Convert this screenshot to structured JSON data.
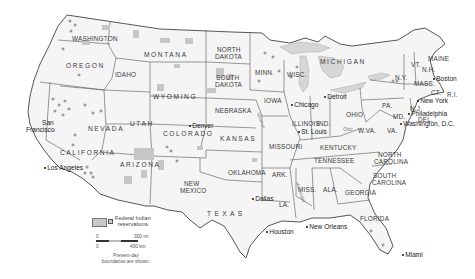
{
  "map": {
    "title": "United States - Federal Indian reservations",
    "states": [
      {
        "name": "WASHINGTON",
        "x": 72,
        "y": 36
      },
      {
        "name": "OREGON",
        "x": 66,
        "y": 63
      },
      {
        "name": "IDAHO",
        "x": 115,
        "y": 72
      },
      {
        "name": "MONTANA",
        "x": 144,
        "y": 52
      },
      {
        "name": "WYOMING",
        "x": 153,
        "y": 94
      },
      {
        "name": "NORTH",
        "x": 217,
        "y": 47
      },
      {
        "name": "DAKOTA",
        "x": 215,
        "y": 54
      },
      {
        "name": "SOUTH",
        "x": 216,
        "y": 75
      },
      {
        "name": "DAKOTA",
        "x": 215,
        "y": 82
      },
      {
        "name": "MINN.",
        "x": 255,
        "y": 70
      },
      {
        "name": "WISC.",
        "x": 287,
        "y": 72
      },
      {
        "name": "NEVADA",
        "x": 88,
        "y": 126
      },
      {
        "name": "UTAH",
        "x": 130,
        "y": 121
      },
      {
        "name": "COLORADO",
        "x": 163,
        "y": 131
      },
      {
        "name": "NEBRASKA",
        "x": 215,
        "y": 108
      },
      {
        "name": "IOWA",
        "x": 264,
        "y": 98
      },
      {
        "name": "KANSAS",
        "x": 220,
        "y": 136
      },
      {
        "name": "CALIFORNIA",
        "x": 60,
        "y": 150
      },
      {
        "name": "ARIZONA",
        "x": 120,
        "y": 162
      },
      {
        "name": "NEW",
        "x": 184,
        "y": 181
      },
      {
        "name": "MEXICO",
        "x": 180,
        "y": 188
      },
      {
        "name": "OKLAHOMA",
        "x": 228,
        "y": 170
      },
      {
        "name": "TEXAS",
        "x": 207,
        "y": 211
      },
      {
        "name": "MISSOURI",
        "x": 269,
        "y": 144
      },
      {
        "name": "ILLINOIS",
        "x": 292,
        "y": 121
      },
      {
        "name": "IND.",
        "x": 317,
        "y": 121
      },
      {
        "name": "OHIO",
        "x": 346,
        "y": 112
      },
      {
        "name": "MICHIGAN",
        "x": 320,
        "y": 59
      },
      {
        "name": "ARK.",
        "x": 272,
        "y": 172
      },
      {
        "name": "LA.",
        "x": 279,
        "y": 202
      },
      {
        "name": "MISS.",
        "x": 298,
        "y": 187
      },
      {
        "name": "ALA.",
        "x": 323,
        "y": 187
      },
      {
        "name": "GEORGIA",
        "x": 345,
        "y": 190
      },
      {
        "name": "FLORIDA",
        "x": 360,
        "y": 216
      },
      {
        "name": "TENNESSEE",
        "x": 314,
        "y": 158
      },
      {
        "name": "KENTUCKY",
        "x": 320,
        "y": 145
      },
      {
        "name": "W.VA.",
        "x": 358,
        "y": 128
      },
      {
        "name": "VA.",
        "x": 387,
        "y": 128
      },
      {
        "name": "PA.",
        "x": 382,
        "y": 103
      },
      {
        "name": "N.Y.",
        "x": 395,
        "y": 75
      },
      {
        "name": "VT.",
        "x": 411,
        "y": 62
      },
      {
        "name": "N.H.",
        "x": 422,
        "y": 67
      },
      {
        "name": "MAINE",
        "x": 428,
        "y": 56
      },
      {
        "name": "MASS.",
        "x": 414,
        "y": 81
      },
      {
        "name": "R.I.",
        "x": 447,
        "y": 92
      },
      {
        "name": "CT.",
        "x": 431,
        "y": 90
      },
      {
        "name": "N.J.",
        "x": 410,
        "y": 106
      },
      {
        "name": "DEL.",
        "x": 418,
        "y": 117
      },
      {
        "name": "MD.",
        "x": 393,
        "y": 114
      },
      {
        "name": "NORTH",
        "x": 378,
        "y": 152
      },
      {
        "name": "CAROLINA",
        "x": 374,
        "y": 159
      },
      {
        "name": "SOUTH",
        "x": 373,
        "y": 173
      },
      {
        "name": "CAROLINA",
        "x": 372,
        "y": 180
      }
    ],
    "cities": [
      {
        "name": "San",
        "x": 42,
        "y": 120
      },
      {
        "name": "Francisco",
        "x": 26,
        "y": 127
      },
      {
        "name": "Los Angeles",
        "x": 43,
        "y": 165
      },
      {
        "name": "Denver",
        "x": 188,
        "y": 123
      },
      {
        "name": "Chicago",
        "x": 290,
        "y": 102
      },
      {
        "name": "St. Louis",
        "x": 297,
        "y": 129
      },
      {
        "name": "Detroit",
        "x": 323,
        "y": 94
      },
      {
        "name": "Boston",
        "x": 432,
        "y": 76
      },
      {
        "name": "New York",
        "x": 416,
        "y": 98
      },
      {
        "name": "Philadelphia",
        "x": 407,
        "y": 111
      },
      {
        "name": "Washington, D.C.",
        "x": 399,
        "y": 121
      },
      {
        "name": "Dallas",
        "x": 251,
        "y": 196
      },
      {
        "name": "Houston",
        "x": 265,
        "y": 229
      },
      {
        "name": "New Orleans",
        "x": 305,
        "y": 224
      },
      {
        "name": "Miami",
        "x": 401,
        "y": 252
      }
    ],
    "rivers": [
      {
        "name": "Missouri",
        "x": 252,
        "y": 118
      },
      {
        "name": "Ohio",
        "x": 343,
        "y": 128
      },
      {
        "name": "Mississippi",
        "x": 289,
        "y": 190
      }
    ],
    "legend": {
      "label_line1": "Federal Indian",
      "label_line2": "reservations",
      "scale_top_start": "0",
      "scale_top_end": "300 mi",
      "scale_bottom_start": "0",
      "scale_bottom_end": "400 km",
      "note_line1": "Present-day",
      "note_line2": "boundaries are shown."
    },
    "colors": {
      "land": "#f4f4f4",
      "border": "#4a4a4a",
      "reservation": "#c4c4c4",
      "water": "#d9d9d9",
      "background": "#ffffff"
    }
  }
}
